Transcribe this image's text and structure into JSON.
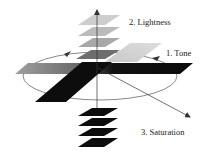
{
  "diagram": {
    "type": "color-space-axes",
    "labels": {
      "tone": "1. Tone",
      "lightness": "2. Lightness",
      "saturation": "3. Saturation"
    },
    "colors": {
      "line": "#333333",
      "plane_dark": "#111111",
      "plane_light_1": "#cfcfcf",
      "plane_light_2": "#bdbdbd",
      "plane_light_3": "#a9a9a9",
      "plane_mid": "#6e6e6e",
      "tone_band_left": "#9a9a9a",
      "tone_band_right": "#0d0d0d",
      "saturation_light_plane": "#d2d2d2"
    },
    "lightness_planes_above": 4,
    "lightness_planes_below": 4
  }
}
